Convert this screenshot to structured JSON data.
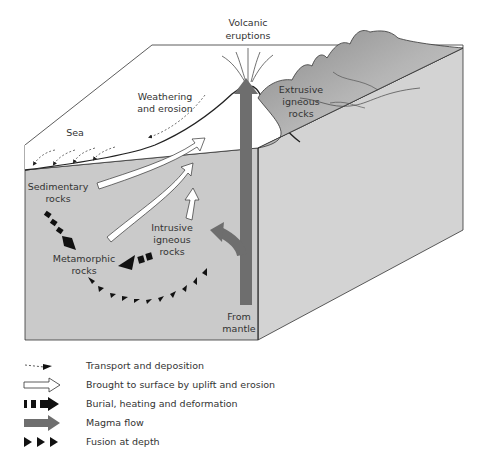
{
  "diagram": {
    "labels": {
      "volcanic_eruptions_line1": "Volcanic",
      "volcanic_eruptions_line2": "eruptions",
      "weathering_line1": "Weathering",
      "weathering_line2": "and erosion",
      "sea": "Sea",
      "extrusive_line1": "Extrusive",
      "extrusive_line2": "igneous",
      "extrusive_line3": "rocks",
      "sedimentary_line1": "Sedimentary",
      "sedimentary_line2": "rocks",
      "intrusive_line1": "Intrusive",
      "intrusive_line2": "igneous",
      "intrusive_line3": "rocks",
      "metamorphic_line1": "Metamorphic",
      "metamorphic_line2": "rocks",
      "mantle_line1": "From",
      "mantle_line2": "mantle"
    },
    "colors": {
      "block_front": "#c9c9c9",
      "block_side": "#d2d2d2",
      "top_surface": "#ffffff",
      "magma": "#6b6b6b",
      "outline": "#333333",
      "arrow_black": "#111111",
      "arrow_white": "#ffffff"
    }
  },
  "legend": {
    "items": [
      {
        "icon": "dashed-arrow-icon",
        "label": "Transport and deposition"
      },
      {
        "icon": "white-arrow-icon",
        "label": "Brought to surface by uplift and erosion"
      },
      {
        "icon": "dashed-black-arrow-icon",
        "label": "Burial, heating and deformation"
      },
      {
        "icon": "grey-arrow-icon",
        "label": "Magma flow"
      },
      {
        "icon": "triangles-icon",
        "label": "Fusion at depth"
      }
    ]
  }
}
